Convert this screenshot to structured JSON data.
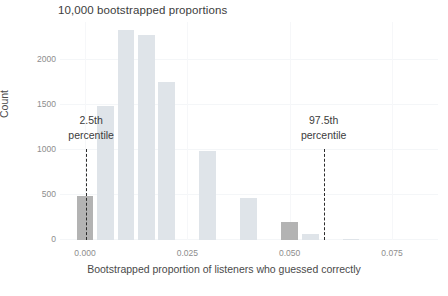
{
  "chart_data": {
    "type": "bar",
    "title": "10,000 bootstrapped proportions",
    "xlabel": "Bootstrapped proportion of listeners who guessed correctly",
    "ylabel": "Count",
    "grid": true,
    "legend": null,
    "xlim": [
      -0.0035,
      0.0825
    ],
    "ylim": [
      0,
      2400
    ],
    "bin_width": 0.005,
    "x_ticks": [
      {
        "value": 0.0,
        "label": "0.000"
      },
      {
        "value": 0.025,
        "label": "0.025"
      },
      {
        "value": 0.05,
        "label": "0.050"
      },
      {
        "value": 0.075,
        "label": "0.075"
      }
    ],
    "y_ticks": [
      {
        "value": 0,
        "label": "0"
      },
      {
        "value": 500,
        "label": "500"
      },
      {
        "value": 1000,
        "label": "1000"
      },
      {
        "value": 1500,
        "label": "1500"
      },
      {
        "value": 2000,
        "label": "2000"
      }
    ],
    "bins": [
      {
        "x_center": 0.0,
        "value": 490,
        "highlight": true
      },
      {
        "x_center": 0.005,
        "value": 1490,
        "highlight": false
      },
      {
        "x_center": 0.01,
        "value": 2330,
        "highlight": false
      },
      {
        "x_center": 0.015,
        "value": 2280,
        "highlight": false
      },
      {
        "x_center": 0.02,
        "value": 1755,
        "highlight": false
      },
      {
        "x_center": 0.03,
        "value": 990,
        "highlight": false
      },
      {
        "x_center": 0.04,
        "value": 465,
        "highlight": false
      },
      {
        "x_center": 0.05,
        "value": 195,
        "highlight": true
      },
      {
        "x_center": 0.055,
        "value": 70,
        "highlight": false
      },
      {
        "x_center": 0.065,
        "value": 15,
        "highlight": false
      }
    ],
    "annotations": [
      {
        "name": "lower-percentile",
        "line1": "2.5th",
        "line2": "percentile",
        "x": 0.0003,
        "line_top_value": 1000,
        "label_x": 0.0015
      },
      {
        "name": "upper-percentile",
        "line1": "97.5th",
        "line2": "percentile",
        "x": 0.0583,
        "line_top_value": 1000,
        "label_x": 0.0583
      }
    ],
    "colors": {
      "bar": "#dfe4e9",
      "bar_highlight": "#b3b3b3",
      "annotation_line": "#2b2b2b",
      "text": "#4a4a4a",
      "tick_text": "#8d8d8d",
      "background": "#ffffff"
    }
  }
}
